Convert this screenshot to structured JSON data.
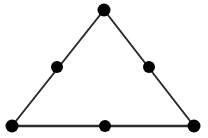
{
  "figure": {
    "type": "geometric-diagram",
    "shape": "triangle",
    "background_color": "#ffffff",
    "stroke_color": "#2b2b2b",
    "vertex_color": "#000000",
    "stroke_width": 2,
    "vertex_radius": 6.5,
    "midpoint_radius": 6,
    "canvas": {
      "width": 208,
      "height": 138
    },
    "vertices": [
      {
        "name": "apex",
        "label": "A",
        "x": 104,
        "y": 10
      },
      {
        "name": "bottom-left",
        "label": "B",
        "x": 12,
        "y": 126
      },
      {
        "name": "bottom-right",
        "label": "C",
        "x": 194,
        "y": 126
      }
    ],
    "midpoints": [
      {
        "name": "left-edge-midpoint",
        "label": "F",
        "x": 57,
        "y": 67
      },
      {
        "name": "right-edge-midpoint",
        "label": "E",
        "x": 149,
        "y": 67
      },
      {
        "name": "bottom-edge-midpoint",
        "label": "D",
        "x": 105,
        "y": 126
      }
    ],
    "edges": [
      {
        "name": "left-edge",
        "x1": 104,
        "y1": 10,
        "x2": 12,
        "y2": 126
      },
      {
        "name": "right-edge",
        "x1": 104,
        "y1": 10,
        "x2": 194,
        "y2": 126
      },
      {
        "name": "bottom-edge",
        "x1": 12,
        "y1": 126,
        "x2": 194,
        "y2": 126
      }
    ],
    "point_count": 6,
    "edge_count": 3
  }
}
